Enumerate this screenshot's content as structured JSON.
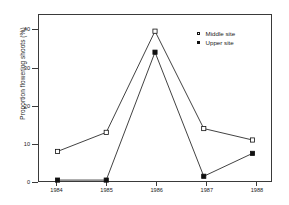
{
  "chart_data": {
    "type": "line",
    "title": "",
    "xlabel": "",
    "ylabel": "Proportion flowering shoots (%)",
    "categories": [
      "1984",
      "1985",
      "1986",
      "1987",
      "1988"
    ],
    "x": [
      1984,
      1985,
      1986,
      1987,
      1988
    ],
    "xlim": [
      1983.6,
      1988.4
    ],
    "ylim": [
      0,
      44
    ],
    "yticks": [
      0,
      10,
      20,
      30,
      40
    ],
    "ytick_labels": [
      "0",
      "10",
      "20",
      "30",
      "40"
    ],
    "xticks": [
      1984,
      1985,
      1986,
      1987,
      1988
    ],
    "xtick_labels": [
      "1984",
      "1985",
      "1986",
      "1987",
      "1988"
    ],
    "grid": false,
    "legend_position": "top-right",
    "series": [
      {
        "name": "Middle site",
        "marker": "open-square",
        "color": "#111111",
        "values": [
          8,
          13,
          39.5,
          14,
          11
        ]
      },
      {
        "name": "Upper site",
        "marker": "filled-square",
        "color": "#111111",
        "values": [
          0.5,
          0.5,
          34,
          1.5,
          7.5
        ]
      }
    ]
  },
  "legend": {
    "items": [
      {
        "label": "Middle site",
        "marker": "open-square"
      },
      {
        "label": "Upper site",
        "marker": "filled-square"
      }
    ]
  }
}
